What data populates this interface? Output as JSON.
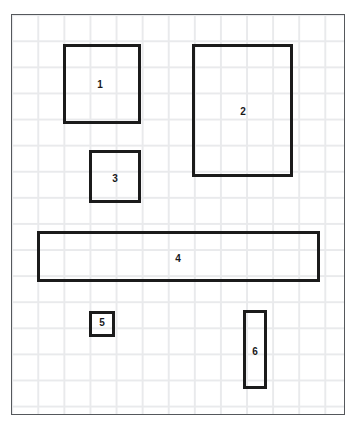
{
  "diagram": {
    "background_color": "#ffffff",
    "plate": {
      "x": 11,
      "y": 14,
      "width": 334,
      "height": 401,
      "border_color": "#55585c",
      "grid_color": "#e9eaec",
      "grid_spacing": 26.1
    },
    "shape_stroke_color": "#1b1b1b",
    "shape_stroke_width": 3,
    "label_color": "#19191b",
    "shapes": [
      {
        "id": "rect-1",
        "label": "1",
        "x": 63,
        "y": 44,
        "width": 78,
        "height": 80,
        "label_x": 100,
        "label_y": 85
      },
      {
        "id": "rect-2",
        "label": "2",
        "x": 192,
        "y": 44,
        "width": 101,
        "height": 133,
        "label_x": 243,
        "label_y": 112
      },
      {
        "id": "rect-3",
        "label": "3",
        "x": 89,
        "y": 150,
        "width": 52,
        "height": 53,
        "label_x": 115,
        "label_y": 179
      },
      {
        "id": "rect-4",
        "label": "4",
        "x": 37,
        "y": 231,
        "width": 283,
        "height": 51,
        "label_x": 178,
        "label_y": 259
      },
      {
        "id": "rect-5",
        "label": "5",
        "x": 89,
        "y": 311,
        "width": 26,
        "height": 26,
        "label_x": 102,
        "label_y": 323
      },
      {
        "id": "rect-6",
        "label": "6",
        "x": 243,
        "y": 310,
        "width": 24,
        "height": 79,
        "label_x": 255,
        "label_y": 352
      }
    ]
  }
}
